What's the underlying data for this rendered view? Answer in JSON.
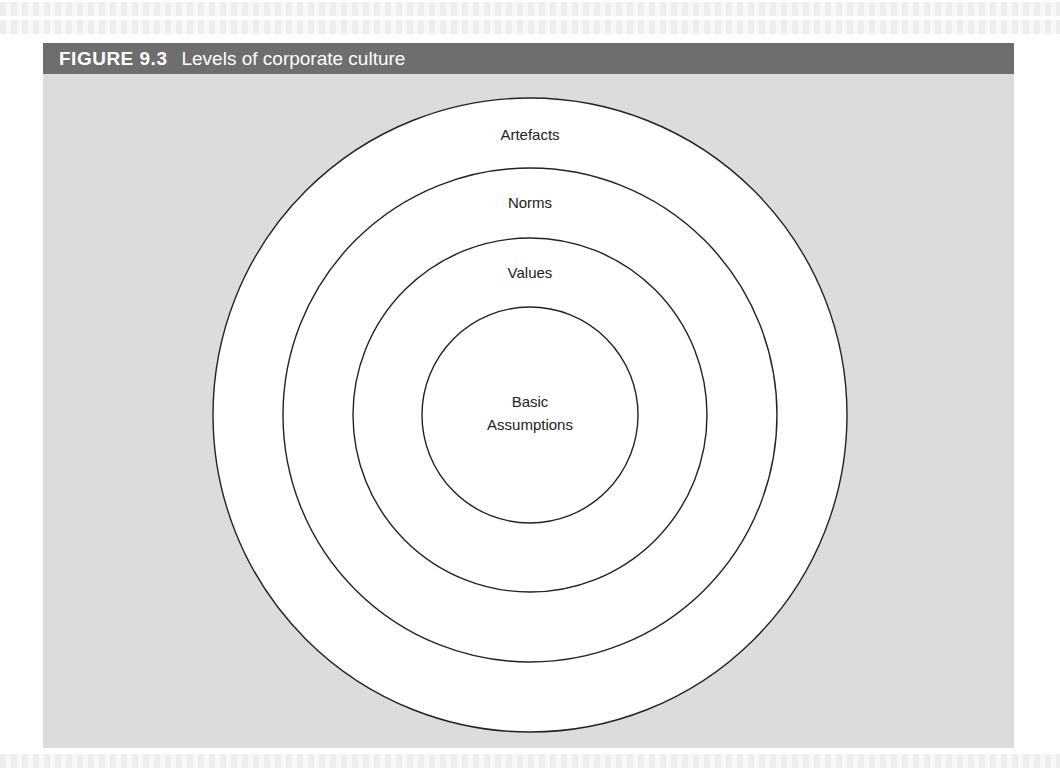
{
  "figure": {
    "number": "FIGURE 9.3",
    "title": "Levels of corporate culture"
  },
  "diagram": {
    "type": "concentric-circles",
    "center": {
      "x": 530,
      "y": 415
    },
    "layers": [
      {
        "label": "Artefacts",
        "radius": 317
      },
      {
        "label": "Norms",
        "radius": 247
      },
      {
        "label": "Values",
        "radius": 177
      },
      {
        "label": "Basic Assumptions",
        "radius": 108,
        "lines": [
          "Basic",
          "Assumptions"
        ]
      }
    ]
  },
  "colors": {
    "header_bg": "#6e6e6e",
    "panel_bg": "#dcdcdc",
    "circle_fill": "#ffffff",
    "circle_stroke": "#222222"
  }
}
